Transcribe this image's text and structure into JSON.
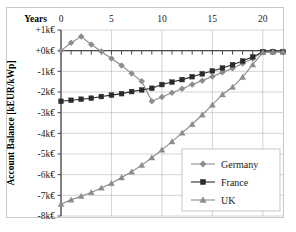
{
  "chart_data": {
    "type": "line",
    "title": "",
    "xlabel": "Years",
    "ylabel": "Account Balance [kEUR/kWp]",
    "xlim": [
      0,
      22
    ],
    "ylim": [
      -8,
      1
    ],
    "grid": true,
    "legend_position": "bottom-right",
    "x_ticks": [
      0,
      5,
      10,
      15,
      20
    ],
    "x_tick_labels": [
      "0",
      "5",
      "10",
      "15",
      "20"
    ],
    "x_minor_tick_step": 1,
    "y_ticks": [
      1,
      0,
      -1,
      -2,
      -3,
      -4,
      -5,
      -6,
      -7,
      -8
    ],
    "y_tick_labels": [
      "+1k€",
      "+0k€",
      "-1k€",
      "-2k€",
      "-3k€",
      "-4k€",
      "-5k€",
      "-6k€",
      "-7k€",
      "-8k€"
    ],
    "x": [
      0,
      1,
      2,
      3,
      4,
      5,
      6,
      7,
      8,
      9,
      10,
      11,
      12,
      13,
      14,
      15,
      16,
      17,
      18,
      19,
      20,
      21,
      22
    ],
    "series": [
      {
        "name": "Germany",
        "marker": "diamond",
        "color": "#8c8c8c",
        "values": [
          0.0,
          0.38,
          0.68,
          0.3,
          -0.04,
          -0.38,
          -0.72,
          -1.1,
          -1.48,
          -2.45,
          -2.24,
          -2.04,
          -1.84,
          -1.64,
          -1.45,
          -1.25,
          -1.05,
          -0.85,
          -0.62,
          -0.38,
          -0.05,
          -0.05,
          -0.05
        ]
      },
      {
        "name": "France",
        "marker": "square",
        "color": "#2b2b2b",
        "values": [
          -2.45,
          -2.4,
          -2.35,
          -2.3,
          -2.22,
          -2.15,
          -2.08,
          -1.98,
          -1.9,
          -1.82,
          -1.64,
          -1.52,
          -1.4,
          -1.26,
          -1.12,
          -0.98,
          -0.84,
          -0.68,
          -0.5,
          -0.3,
          -0.05,
          -0.05,
          -0.05
        ]
      },
      {
        "name": "UK",
        "marker": "triangle",
        "color": "#8c8c8c",
        "values": [
          -7.42,
          -7.22,
          -7.04,
          -6.86,
          -6.64,
          -6.42,
          -6.14,
          -5.86,
          -5.54,
          -5.18,
          -4.8,
          -4.4,
          -3.98,
          -3.56,
          -3.1,
          -2.62,
          -2.12,
          -1.76,
          -1.28,
          -0.68,
          -0.08,
          -0.05,
          -0.05
        ]
      }
    ]
  },
  "legend": {
    "items": [
      {
        "label": "Germany"
      },
      {
        "label": "France"
      },
      {
        "label": "UK"
      }
    ]
  },
  "axes": {
    "x_title": "Years",
    "y_title": "Account Balance [kEUR/kWp]"
  },
  "colors": {
    "germany": "#8c8c8c",
    "france": "#2b2b2b",
    "uk": "#8c8c8c",
    "grid": "#b9b9b9",
    "axis": "#4a4a4a",
    "frame": "#c8c8c8",
    "background": "#ffffff"
  }
}
